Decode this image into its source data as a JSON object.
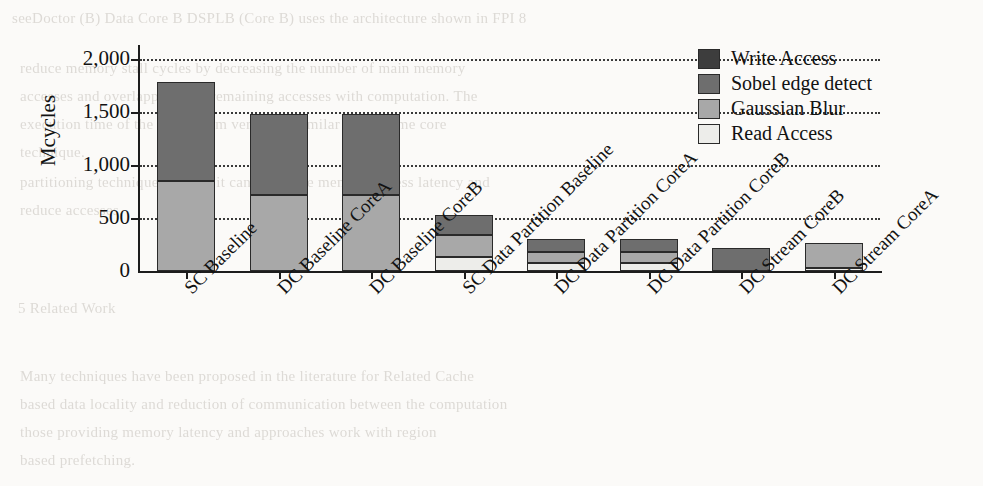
{
  "chart_data": {
    "type": "bar",
    "subtype": "stacked-bar",
    "title": "",
    "xlabel": "",
    "ylabel": "Mcycles",
    "ylim": [
      0,
      2100
    ],
    "yticks": [
      0,
      500,
      1000,
      1500,
      2000
    ],
    "ytick_labels": [
      "0",
      "500",
      "1,000",
      "1,500",
      "2,000"
    ],
    "grid": true,
    "grid_style": "dotted-horizontal",
    "legend_position": "top-right",
    "categories": [
      "SC Baseline",
      "DC Baseline CoreA",
      "DC Baseline CoreB",
      "SC Data Partition Baseline",
      "DC Data Partition CoreA",
      "DC Data Partition CoreB",
      "DC Stream CoreB",
      "DC Stream CoreA"
    ],
    "series": [
      {
        "name": "Read Access",
        "color": "#ededea",
        "values": [
          0,
          0,
          0,
          130,
          75,
          75,
          0,
          30
        ]
      },
      {
        "name": "Gaussian Blur",
        "color": "#a8a8a8",
        "values": [
          850,
          720,
          720,
          205,
          100,
          100,
          0,
          235
        ]
      },
      {
        "name": "Sobel edge detect",
        "color": "#6e6e6e",
        "values": [
          930,
          760,
          760,
          195,
          125,
          125,
          220,
          0
        ]
      },
      {
        "name": "Write Access",
        "color": "#3d3d3d",
        "values": [
          0,
          0,
          0,
          0,
          0,
          0,
          0,
          0
        ]
      }
    ],
    "totals": [
      1780,
      1480,
      1480,
      530,
      300,
      300,
      220,
      265
    ]
  },
  "legend": {
    "entries": [
      {
        "label": "Write Access",
        "color": "#3d3d3d"
      },
      {
        "label": "Sobel edge detect",
        "color": "#6e6e6e"
      },
      {
        "label": "Gaussian Blur",
        "color": "#a8a8a8"
      },
      {
        "label": "Read Access",
        "color": "#ededea"
      }
    ]
  },
  "background_text": [
    {
      "text": "seeDoctor (B) Data Core B DSPLB (Core B) uses the architecture shown in FPI 8",
      "x": 12,
      "y": 10
    },
    {
      "text": "reduce memory stall cycles by decreasing the number of main memory",
      "x": 20,
      "y": 60
    },
    {
      "text": "accesses and overlapping that remaining accesses with computation. The",
      "x": 20,
      "y": 88
    },
    {
      "text": "execution time of the DC Stream version is similar to the same core",
      "x": 20,
      "y": 116
    },
    {
      "text": "technique.",
      "x": 20,
      "y": 144
    },
    {
      "text": "partitioning technique because it can both hide memory access latency and",
      "x": 20,
      "y": 174
    },
    {
      "text": "reduce accesses.",
      "x": 20,
      "y": 202
    },
    {
      "text": "5   Related Work",
      "x": 18,
      "y": 300
    },
    {
      "text": "Many techniques have been proposed in the literature for Related Cache",
      "x": 20,
      "y": 368
    },
    {
      "text": "based data locality and reduction of communication between the computation",
      "x": 20,
      "y": 396
    },
    {
      "text": "those providing memory latency and approaches work with region",
      "x": 20,
      "y": 424
    },
    {
      "text": "based prefetching.",
      "x": 20,
      "y": 452
    }
  ]
}
